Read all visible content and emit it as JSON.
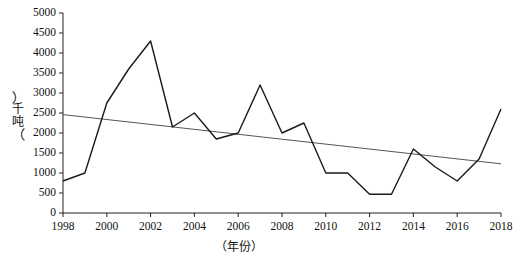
{
  "chart_data": {
    "type": "line",
    "title": "",
    "xlabel": "（年份）",
    "ylabel": "（千吨）",
    "xlim": [
      1998,
      2018
    ],
    "ylim": [
      0,
      5000
    ],
    "grid": false,
    "legend": "none",
    "x_tick_labels": [
      "1998",
      "2000",
      "2002",
      "2004",
      "2006",
      "2008",
      "2010",
      "2012",
      "2014",
      "2016",
      "2018"
    ],
    "x_ticks": [
      1998,
      2000,
      2002,
      2004,
      2006,
      2008,
      2010,
      2012,
      2014,
      2016,
      2018
    ],
    "y_tick_labels": [
      "0",
      "500",
      "1000",
      "1500",
      "2000",
      "2500",
      "3000",
      "3500",
      "4000",
      "4500",
      "5000"
    ],
    "y_ticks": [
      0,
      500,
      1000,
      1500,
      2000,
      2500,
      3000,
      3500,
      4000,
      4500,
      5000
    ],
    "x": [
      1998,
      1999,
      2000,
      2001,
      2002,
      2003,
      2004,
      2005,
      2006,
      2007,
      2008,
      2009,
      2010,
      2011,
      2012,
      2013,
      2014,
      2015,
      2016,
      2017,
      2018
    ],
    "series": [
      {
        "name": "年产量",
        "kind": "data",
        "color": "#1a1a1a",
        "values": [
          800,
          1000,
          2750,
          3600,
          4300,
          2150,
          2500,
          1850,
          2000,
          3200,
          2000,
          2250,
          1000,
          1000,
          470,
          470,
          1600,
          1150,
          800,
          1350,
          2600
        ]
      },
      {
        "name": "趋势线",
        "kind": "trend",
        "color": "#555555",
        "endpoints": [
          {
            "x": 1998,
            "y": 2460
          },
          {
            "x": 2018,
            "y": 1230
          }
        ]
      }
    ]
  },
  "axes": {
    "y_title_chars": [
      "千",
      "吨"
    ],
    "y_title_open_paren": "︵",
    "y_title_close_paren": "︶",
    "x_title": "（年份）"
  }
}
